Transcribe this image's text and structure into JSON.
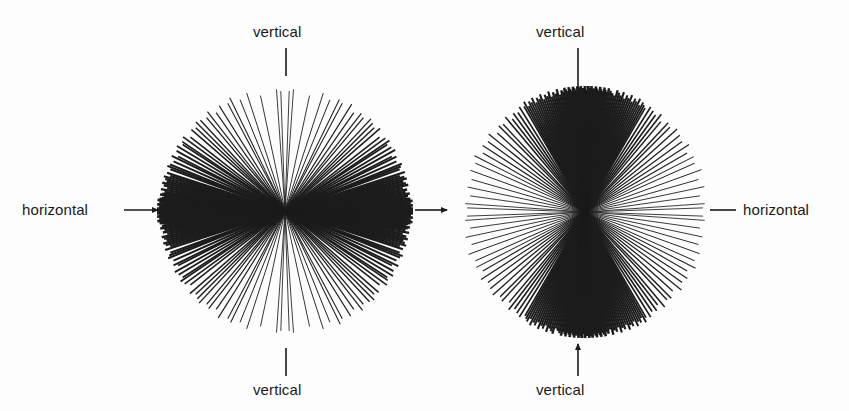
{
  "figure": {
    "background_color": "#fdfdfd",
    "ink_color": "#1a1a1a",
    "width": 849,
    "height": 411
  },
  "labels": {
    "left_vertical_top": "vertical",
    "left_vertical_bottom": "vertical",
    "left_horizontal": "horizontal",
    "right_vertical_top": "vertical",
    "right_vertical_bottom": "vertical",
    "right_horizontal": "horizontal"
  },
  "pointers": {
    "left_vertical_top": {
      "type": "tick-line",
      "direction": "down"
    },
    "left_vertical_bottom": {
      "type": "tick-line",
      "direction": "up"
    },
    "left_horizontal": {
      "type": "arrow",
      "direction": "right"
    },
    "left_center_horizontal": {
      "type": "arrow",
      "direction": "right"
    },
    "right_vertical_top": {
      "type": "tick-line",
      "direction": "down"
    },
    "right_vertical_bottom": {
      "type": "arrow",
      "direction": "up"
    },
    "right_horizontal": {
      "type": "dash",
      "direction": "left"
    }
  },
  "chart_data": {
    "type": "line",
    "subtype": "radial-ray-orientation-diagram",
    "title": "",
    "xlabel": "",
    "ylabel": "",
    "panels": [
      {
        "name": "left-panel",
        "center": [
          285,
          211
        ],
        "radius": 128,
        "reference_axes": [
          "vertical",
          "horizontal"
        ],
        "concentration": "horizontal",
        "angle_unit": "degrees-from-horizontal",
        "angles": [
          -88,
          -86,
          -78,
          -72,
          -68,
          -64,
          -62,
          -58,
          -55,
          -52,
          -50,
          -47,
          -45,
          -43,
          -41,
          -38,
          -36,
          -34,
          -33,
          -31,
          -29,
          -27,
          -26,
          -24,
          -22,
          -21,
          -20,
          -18,
          -17,
          -16,
          -15,
          -14,
          -13,
          -12,
          -11,
          -10,
          -9,
          -8,
          -7.5,
          -7,
          -6,
          -5.5,
          -5,
          -4.5,
          -4,
          -3.5,
          -3,
          -2.5,
          -2,
          -1.5,
          -1,
          -0.5,
          0,
          0.5,
          1,
          1.5,
          2,
          2.5,
          3,
          3.5,
          4,
          4.5,
          5,
          5.5,
          6,
          7,
          8,
          9,
          10,
          11,
          12,
          13,
          14,
          15,
          16,
          17,
          18,
          20,
          21,
          22,
          24,
          26,
          27,
          29,
          31,
          33,
          34,
          36,
          38,
          41,
          43,
          45,
          47,
          50,
          52,
          55,
          58,
          62,
          64,
          68,
          72,
          78,
          86,
          88
        ],
        "ray_lengths_px": [
          120,
          122,
          118,
          124,
          120,
          126,
          122,
          124,
          120,
          126,
          122,
          124,
          126,
          122,
          124,
          120,
          126,
          124,
          122,
          126,
          124,
          120,
          126,
          122,
          124,
          126,
          122,
          124,
          120,
          126,
          124,
          122,
          126,
          124,
          120,
          126,
          122,
          124,
          126,
          122,
          124,
          126,
          128,
          124,
          126,
          122,
          128,
          124,
          126,
          122,
          128,
          126,
          128,
          126,
          128,
          124,
          126,
          128,
          124,
          126,
          122,
          128,
          124,
          126,
          122,
          124,
          126,
          122,
          124,
          120,
          126,
          124,
          122,
          126,
          124,
          120,
          126,
          122,
          124,
          126,
          122,
          124,
          120,
          126,
          124,
          122,
          126,
          124,
          120,
          126,
          122,
          124,
          126,
          122,
          124,
          120,
          126,
          122,
          124,
          120,
          124,
          118,
          122,
          120
        ]
      },
      {
        "name": "right-panel",
        "center": [
          585,
          212
        ],
        "radius": 126,
        "reference_axes": [
          "vertical",
          "horizontal"
        ],
        "concentration": "vertical",
        "angle_unit": "degrees-from-horizontal",
        "angles": [
          2,
          4,
          8,
          12,
          16,
          20,
          24,
          27,
          30,
          33,
          36,
          39,
          42,
          45,
          47,
          50,
          52,
          54,
          56,
          58,
          60,
          61,
          62,
          63,
          64,
          65,
          66,
          67,
          68,
          69,
          70,
          71,
          72,
          73,
          74,
          75,
          76,
          77,
          78,
          79,
          80,
          80.5,
          81,
          81.5,
          82,
          82.5,
          83,
          83.5,
          84,
          84.5,
          85,
          85.5,
          86,
          86.5,
          87,
          87.5,
          88,
          88.5,
          89,
          89.5,
          90,
          -89.5,
          -89,
          -88.5,
          -88,
          -87.5,
          -87,
          -86.5,
          -86,
          -85.5,
          -85,
          -84.5,
          -84,
          -83.5,
          -83,
          -82.5,
          -82,
          -81.5,
          -81,
          -80.5,
          -80,
          -79,
          -78,
          -77,
          -76,
          -75,
          -74,
          -73,
          -72,
          -71,
          -70,
          -69,
          -68,
          -67,
          -66,
          -65,
          -64,
          -63,
          -62,
          -61,
          -60,
          -58,
          -56,
          -54,
          -52,
          -50,
          -47,
          -45,
          -42,
          -39,
          -36,
          -33,
          -30,
          -27,
          -24,
          -20,
          -16,
          -12,
          -8,
          -4,
          -2
        ],
        "ray_lengths_px": [
          118,
          120,
          116,
          122,
          118,
          124,
          120,
          122,
          118,
          124,
          120,
          122,
          124,
          120,
          122,
          118,
          124,
          120,
          122,
          124,
          120,
          122,
          124,
          120,
          126,
          122,
          124,
          120,
          126,
          122,
          124,
          120,
          126,
          122,
          124,
          126,
          120,
          122,
          124,
          126,
          122,
          124,
          126,
          120,
          122,
          124,
          126,
          120,
          122,
          124,
          126,
          122,
          124,
          120,
          126,
          122,
          124,
          126,
          120,
          122,
          126,
          122,
          124,
          120,
          126,
          122,
          124,
          126,
          120,
          122,
          124,
          126,
          120,
          122,
          124,
          126,
          122,
          120,
          124,
          126,
          122,
          124,
          120,
          126,
          122,
          124,
          120,
          126,
          122,
          124,
          120,
          126,
          122,
          124,
          120,
          126,
          122,
          124,
          120,
          126,
          122,
          124,
          120,
          122,
          118,
          124,
          120,
          122,
          118,
          124,
          120,
          122,
          118,
          124,
          120,
          122,
          118,
          120,
          116,
          120,
          118
        ]
      }
    ],
    "legend": [],
    "grid": false
  }
}
